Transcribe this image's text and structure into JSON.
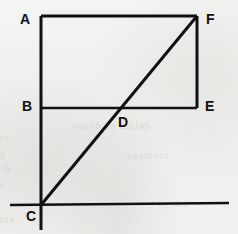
{
  "figure": {
    "kind": "geometry-diagram",
    "width": 238,
    "height": 234,
    "background_color": "#f2f2f0",
    "stroke_color": "#111111",
    "label_color": "#111111",
    "labels": [
      {
        "id": "A",
        "text": "A",
        "x": 20,
        "y": 12
      },
      {
        "id": "F",
        "text": "F",
        "x": 206,
        "y": 12
      },
      {
        "id": "B",
        "text": "B",
        "x": 22,
        "y": 99
      },
      {
        "id": "E",
        "text": "E",
        "x": 205,
        "y": 99
      },
      {
        "id": "D",
        "text": "D",
        "x": 118,
        "y": 115
      },
      {
        "id": "C",
        "text": "C",
        "x": 26,
        "y": 209
      }
    ],
    "points": {
      "A": {
        "x": 41,
        "y": 16
      },
      "F": {
        "x": 197,
        "y": 16
      },
      "B": {
        "x": 41,
        "y": 108
      },
      "E": {
        "x": 197,
        "y": 108
      },
      "D": {
        "x": 116,
        "y": 108
      },
      "C": {
        "x": 41,
        "y": 205
      }
    },
    "segments": [
      {
        "id": "AF",
        "label": "A-F",
        "from": "A",
        "to": "F",
        "x1": 41,
        "y1": 16,
        "x2": 197,
        "y2": 16,
        "width": 3.0
      },
      {
        "id": "FE",
        "label": "F-E",
        "from": "F",
        "to": "E",
        "x1": 197,
        "y1": 16,
        "x2": 197,
        "y2": 108,
        "width": 3.0
      },
      {
        "id": "BE",
        "label": "B-E",
        "from": "B",
        "to": "E",
        "x1": 41,
        "y1": 108,
        "x2": 197,
        "y2": 108,
        "width": 2.6
      },
      {
        "id": "AC",
        "label": "A-through-B-to-C",
        "from": "A",
        "to": "C",
        "x1": 41,
        "y1": 16,
        "x2": 41,
        "y2": 230,
        "width": 3.0
      },
      {
        "id": "CF",
        "label": "C-through-D-to-F",
        "from": "C",
        "to": "F",
        "x1": 41,
        "y1": 205,
        "x2": 197,
        "y2": 16,
        "width": 3.0
      },
      {
        "id": "baseline",
        "label": "horizontal-baseline-through-C",
        "from": "left-edge",
        "to": "right-edge",
        "x1": 10,
        "y1": 205,
        "x2": 229,
        "y2": 203,
        "width": 2.6
      }
    ],
    "bleed_through_lines": [
      {
        "text": "ehT .noitcerid etisoppo",
        "x": 8,
        "y": 130
      },
      {
        "text": "gniwollof eht ni nwohs sa",
        "x": 5,
        "y": 146
      },
      {
        "text": "dluow rotcev eht woh",
        "x": 10,
        "y": 161
      },
      {
        "text": "ni egnahc eht fo edutingam",
        "x": 4,
        "y": 177
      },
      {
        "text": "eht si siht dna",
        "x": 14,
        "y": 212
      },
      {
        "text": "delacs eb dluow",
        "x": 150,
        "y": 118
      },
      {
        "text": "tnemges",
        "x": 168,
        "y": 148
      },
      {
        "text": "eht ni",
        "x": 186,
        "y": 196
      }
    ]
  }
}
